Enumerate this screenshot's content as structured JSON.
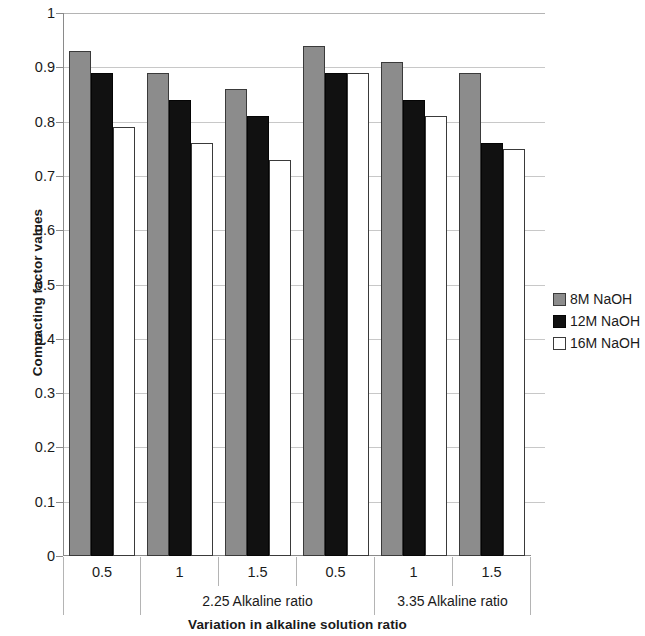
{
  "chart_data": {
    "type": "bar",
    "title": "",
    "xlabel": "Variation in alkaline solution ratio",
    "ylabel": "Compacting factor values",
    "categories": [
      "0.5",
      "1",
      "1.5",
      "0.5",
      "1",
      "1.5"
    ],
    "group_labels": [
      "2.25 Alkaline ratio",
      "3.35 Alkaline ratio"
    ],
    "series": [
      {
        "name": "8M NaOH",
        "color": "#8c8c8c",
        "values": [
          0.93,
          0.89,
          0.86,
          0.94,
          0.91,
          0.89
        ]
      },
      {
        "name": "12M NaOH",
        "color": "#111111",
        "values": [
          0.89,
          0.84,
          0.81,
          0.89,
          0.84,
          0.76
        ]
      },
      {
        "name": "16M NaOH",
        "color": "#ffffff",
        "values": [
          0.79,
          0.76,
          0.73,
          0.89,
          0.81,
          0.75
        ]
      }
    ],
    "ylim": [
      0,
      1
    ],
    "yticks": [
      "0",
      "0.1",
      "0.2",
      "0.3",
      "0.4",
      "0.5",
      "0.6",
      "0.7",
      "0.8",
      "0.9",
      "1"
    ],
    "grid": true,
    "legend_position": "right"
  },
  "axes": {
    "y_title": "Compacting factor values",
    "x_title": "Variation in alkaline solution ratio"
  },
  "legend": {
    "entries": [
      {
        "label": "8M NaOH"
      },
      {
        "label": "12M NaOH"
      },
      {
        "label": "16M NaOH"
      }
    ]
  },
  "x_axis_rows": {
    "tick_labels": [
      "0.5",
      "1",
      "1.5",
      "0.5",
      "1",
      "1.5"
    ],
    "group_row": [
      "",
      "2.25 Alkaline ratio",
      "3.35 Alkaline ratio"
    ]
  }
}
